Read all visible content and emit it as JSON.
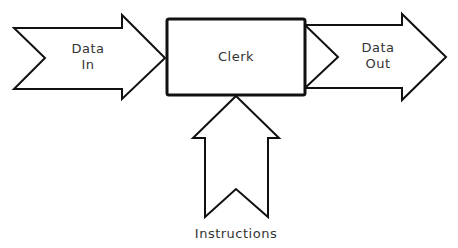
{
  "diagram": {
    "title": "",
    "nodes": [
      {
        "id": "clerk",
        "label": "Clerk",
        "shape": "rectangle"
      }
    ],
    "arrows": [
      {
        "id": "data-in",
        "label_lines": [
          "Data",
          "In"
        ],
        "direction": "right",
        "target": "clerk"
      },
      {
        "id": "data-out",
        "label_lines": [
          "Data",
          "Out"
        ],
        "direction": "right",
        "source": "clerk"
      },
      {
        "id": "instructions",
        "label": "Instructions",
        "direction": "up",
        "target": "clerk"
      }
    ]
  },
  "labels": {
    "data_in_line1": "Data",
    "data_in_line2": "In",
    "clerk": "Clerk",
    "data_out_line1": "Data",
    "data_out_line2": "Out",
    "instructions": "Instructions"
  },
  "colors": {
    "stroke": "#111111",
    "fill": "#ffffff",
    "text": "#333333"
  }
}
